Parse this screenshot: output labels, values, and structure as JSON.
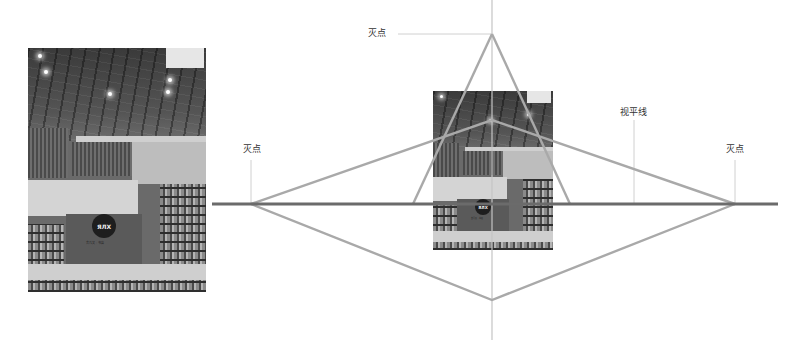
{
  "diagram": {
    "type": "two-point / three-point perspective illustration",
    "labels": {
      "vanishing_point_top": "灭点",
      "vanishing_point_left": "灭点",
      "vanishing_point_right": "灭点",
      "horizon_line": "视平线"
    },
    "photo_left": {
      "logo_text": "ЯЛX",
      "logo_caption": "言几又 · 书店"
    },
    "photo_center": {
      "logo_text": "ЯЛX",
      "logo_caption": "言几又 · 书店"
    },
    "colors": {
      "horizon_line": "#6b6b6b",
      "perspective_lines": "#a9a9a9",
      "leader_lines": "#d0d0d0",
      "center_axis": "#c4c4c4",
      "label_text": "#333333"
    },
    "points": {
      "vp_left": [
        251,
        204
      ],
      "vp_right": [
        735,
        204
      ],
      "vp_top": [
        492,
        34
      ],
      "vp_bottom": [
        492,
        300
      ],
      "inner_apex": [
        492,
        120
      ]
    }
  }
}
